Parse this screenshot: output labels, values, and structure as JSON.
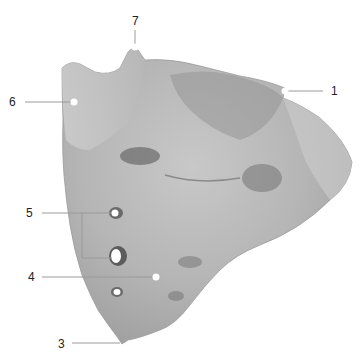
{
  "figure": {
    "labels": [
      {
        "id": "1",
        "text": "1",
        "x": 333,
        "y": 86
      },
      {
        "id": "3",
        "text": "3",
        "x": 58,
        "y": 339
      },
      {
        "id": "4",
        "text": "4",
        "x": 28,
        "y": 273
      },
      {
        "id": "5",
        "text": "5",
        "x": 25,
        "y": 208
      },
      {
        "id": "6",
        "text": "6",
        "x": 9,
        "y": 97
      },
      {
        "id": "7",
        "text": "7",
        "x": 133,
        "y": 16
      }
    ],
    "colors": {
      "bone": "#b9b9b9",
      "bone_dark": "#8c8c8c",
      "bone_light": "#d6d6d6",
      "leader": "#9a9a9a",
      "text": "#222222"
    }
  }
}
